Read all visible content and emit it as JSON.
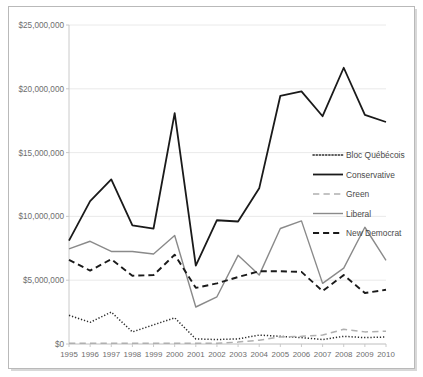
{
  "chart_data": {
    "type": "line",
    "title": "",
    "xlabel": "",
    "ylabel": "",
    "x": [
      1995,
      1996,
      1997,
      1998,
      1999,
      2000,
      2001,
      2002,
      2003,
      2004,
      2005,
      2006,
      2007,
      2008,
      2009,
      2010
    ],
    "categories": [
      "1995",
      "1996",
      "1997",
      "1998",
      "1999",
      "2000",
      "2001",
      "2002",
      "2003",
      "2004",
      "2005",
      "2006",
      "2007",
      "2008",
      "2009",
      "2010"
    ],
    "ylim": [
      0,
      25000000
    ],
    "yticks": [
      0,
      5000000,
      10000000,
      15000000,
      20000000,
      25000000
    ],
    "ytick_labels": [
      "$0",
      "$5,000,000",
      "$10,000,000",
      "$15,000,000",
      "$20,000,000",
      "$25,000,000"
    ],
    "grid": true,
    "legend_position": "middle-right",
    "series": [
      {
        "name": "Bloc Québécois",
        "style": "dotted",
        "color": "#2b2b2b",
        "width": 1.5,
        "values": [
          2250000,
          1700000,
          2500000,
          950000,
          1500000,
          2050000,
          400000,
          350000,
          400000,
          700000,
          600000,
          500000,
          350000,
          600000,
          500000,
          550000
        ]
      },
      {
        "name": "Conservative",
        "style": "solid",
        "color": "#1a1a1a",
        "width": 1.8,
        "values": [
          8100000,
          11200000,
          12900000,
          9300000,
          9050000,
          18100000,
          6150000,
          9700000,
          9600000,
          12200000,
          19450000,
          19800000,
          17850000,
          21650000,
          17950000,
          17400000
        ]
      },
      {
        "name": "Green",
        "style": "dashed-light",
        "color": "#b0b0b0",
        "width": 1.5,
        "values": [
          60000,
          60000,
          60000,
          60000,
          60000,
          60000,
          60000,
          60000,
          150000,
          300000,
          550000,
          600000,
          700000,
          1150000,
          950000,
          1000000
        ]
      },
      {
        "name": "Liberal",
        "style": "solid",
        "color": "#8a8a8a",
        "width": 1.4,
        "values": [
          7450000,
          8050000,
          7250000,
          7250000,
          7050000,
          8500000,
          2900000,
          3700000,
          6950000,
          5400000,
          9050000,
          9650000,
          4750000,
          5950000,
          9150000,
          6550000
        ]
      },
      {
        "name": "New Democrat",
        "style": "dashed",
        "color": "#1a1a1a",
        "width": 1.9,
        "values": [
          6600000,
          5750000,
          6650000,
          5350000,
          5400000,
          7000000,
          4400000,
          4750000,
          5250000,
          5700000,
          5700000,
          5650000,
          4150000,
          5400000,
          4000000,
          4250000
        ]
      }
    ]
  },
  "legend": {
    "items": [
      {
        "label": "Bloc Québécois"
      },
      {
        "label": "Conservative"
      },
      {
        "label": "Green"
      },
      {
        "label": "Liberal"
      },
      {
        "label": "New Democrat"
      }
    ]
  }
}
